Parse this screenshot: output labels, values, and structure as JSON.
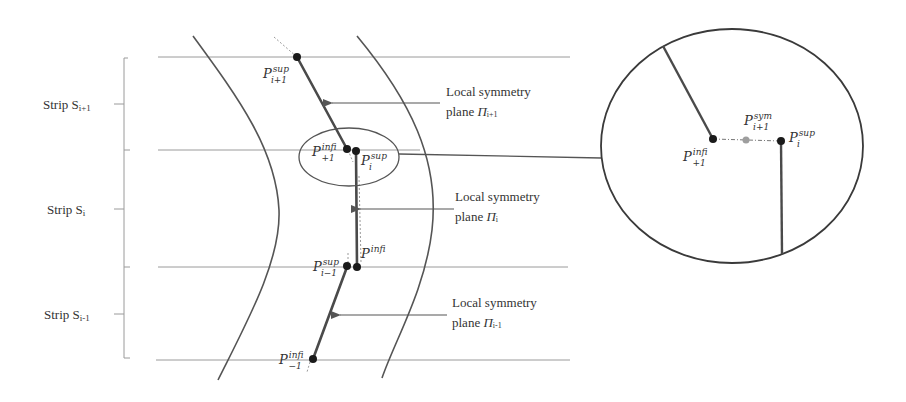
{
  "figure": {
    "colors": {
      "stroke": "#555555",
      "dark": "#2b2b2b",
      "thin_line": "#9a9a9a",
      "point": "#1a1a1a",
      "sym_point": "#9e9e9e",
      "text": "#333333"
    }
  },
  "strips": [
    {
      "id": "strip-i+1",
      "label": "Strip S",
      "sub": "i+1"
    },
    {
      "id": "strip-i",
      "label": "Strip S",
      "sub": "i"
    },
    {
      "id": "strip-i-1",
      "label": "Strip S",
      "sub": "i-1"
    }
  ],
  "planes": [
    {
      "id": "plane-i+1",
      "line1": "Local symmetry",
      "line2": "plane ",
      "symbol": "Π",
      "sub": "i+1"
    },
    {
      "id": "plane-i",
      "line1": "Local symmetry",
      "line2": "plane ",
      "symbol": "Π",
      "sub": "i"
    },
    {
      "id": "plane-i-1",
      "line1": "Local symmetry",
      "line2": "plane ",
      "symbol": "Π",
      "sub": "i-1"
    }
  ],
  "points": {
    "p_sup_i1": {
      "base": "P",
      "sup": "sup",
      "sub": "i+1"
    },
    "p_inf_i1": {
      "base": "P",
      "sup": "inf",
      "sub": "i+1"
    },
    "p_sup_i": {
      "base": "P",
      "sup": "sup",
      "sub": "i"
    },
    "p_inf_i": {
      "base": "P",
      "sup": "inf",
      "sub": "i"
    },
    "p_sup_im1": {
      "base": "P",
      "sup": "sup",
      "sub": "i−1"
    },
    "p_inf_im1": {
      "base": "P",
      "sup": "inf",
      "sub": "i−1"
    }
  },
  "inset": {
    "p_inf_i1": {
      "base": "P",
      "sup": "inf",
      "sub": "i+1"
    },
    "p_sym_i1": {
      "base": "P",
      "sup": "sym",
      "sub": "i+1"
    },
    "p_sup_i": {
      "base": "P",
      "sup": "sup",
      "sub": "i"
    }
  }
}
